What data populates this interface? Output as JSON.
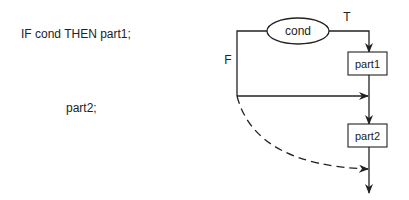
{
  "code": {
    "line1": "IF cond THEN part1;",
    "line2": "part2;"
  },
  "flowchart": {
    "condition": "cond",
    "true_label": "T",
    "false_label": "F",
    "box1": "part1",
    "box2": "part2",
    "stroke_color": "#222222",
    "dashed_edge": "F-branch to after part2"
  }
}
